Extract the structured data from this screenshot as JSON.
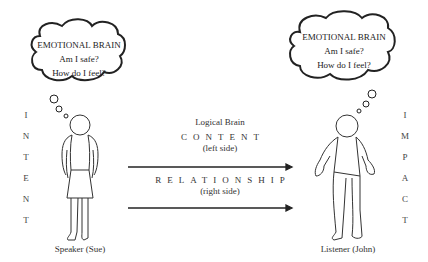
{
  "speaker": {
    "thought": {
      "title": "EMOTIONAL BRAIN",
      "line1": "Am I safe?",
      "line2": "How do I feel?"
    },
    "label": "Speaker (Sue)",
    "side_word": [
      "I",
      "N",
      "T",
      "E",
      "N",
      "T"
    ]
  },
  "listener": {
    "thought": {
      "title": "EMOTIONAL BRAIN",
      "line1": "Am I safe?",
      "line2": "How do I feel?"
    },
    "label": "Listener (John)",
    "side_word": [
      "I",
      "M",
      "P",
      "A",
      "C",
      "T"
    ]
  },
  "middle": {
    "logical_brain": "Logical Brain",
    "content": "CONTENT",
    "content_sub": "(left side)",
    "relationship": "RELATIONSHIP",
    "relationship_sub": "(right side)"
  },
  "colors": {
    "line": "#222222",
    "text": "#333333",
    "background": "#ffffff"
  }
}
